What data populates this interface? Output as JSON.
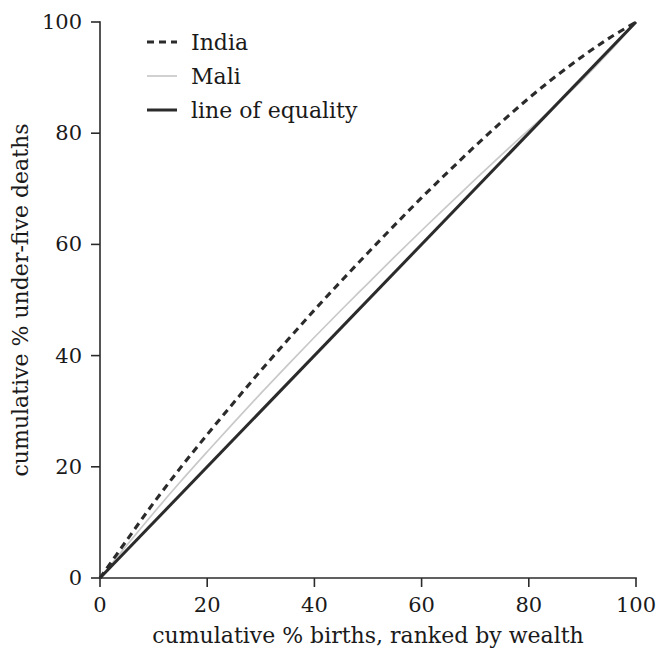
{
  "chart_data": {
    "type": "line",
    "title": "",
    "subtitle": "",
    "xlabel": "cumulative % births, ranked by wealth",
    "ylabel": "cumulative % under-five deaths",
    "xlim": [
      0,
      100
    ],
    "ylim": [
      0,
      100
    ],
    "xticks": [
      0,
      20,
      40,
      60,
      80,
      100
    ],
    "yticks": [
      0,
      20,
      40,
      60,
      80,
      100
    ],
    "xtick_labels": [
      "0",
      "20",
      "40",
      "60",
      "80",
      "100"
    ],
    "ytick_labels": [
      "0",
      "20",
      "40",
      "60",
      "80",
      "100"
    ],
    "grid": false,
    "legend_position": "top-left",
    "x": [
      0,
      5,
      10,
      15,
      20,
      25,
      30,
      35,
      40,
      45,
      50,
      55,
      60,
      65,
      70,
      75,
      80,
      85,
      90,
      95,
      100
    ],
    "series": [
      {
        "name": "India",
        "style": "dashed",
        "color": "#2b2b2b",
        "values": [
          0,
          6.8,
          13.5,
          19.8,
          25.8,
          31.6,
          37.3,
          42.8,
          48.2,
          53.4,
          58.5,
          63.5,
          68.4,
          73.1,
          77.7,
          82.1,
          86.3,
          90.2,
          93.8,
          97.1,
          100
        ]
      },
      {
        "name": "Mali",
        "style": "solid",
        "color": "#c9c9c9",
        "values": [
          0,
          5.9,
          11.7,
          17.3,
          22.7,
          28.0,
          33.2,
          38.3,
          43.3,
          48.2,
          53.0,
          57.8,
          62.5,
          67.1,
          71.7,
          76.2,
          80.6,
          85.0,
          89.6,
          94.6,
          100
        ]
      },
      {
        "name": "line of equality",
        "style": "solid",
        "color": "#2b2b2b",
        "values": [
          0,
          5,
          10,
          15,
          20,
          25,
          30,
          35,
          40,
          45,
          50,
          55,
          60,
          65,
          70,
          75,
          80,
          85,
          90,
          95,
          100
        ]
      }
    ],
    "legend": [
      {
        "label": "India",
        "style": "dashed",
        "color": "#2b2b2b"
      },
      {
        "label": "Mali",
        "style": "solid",
        "color": "#c9c9c9"
      },
      {
        "label": "line of equality",
        "style": "solid",
        "color": "#2b2b2b"
      }
    ]
  }
}
